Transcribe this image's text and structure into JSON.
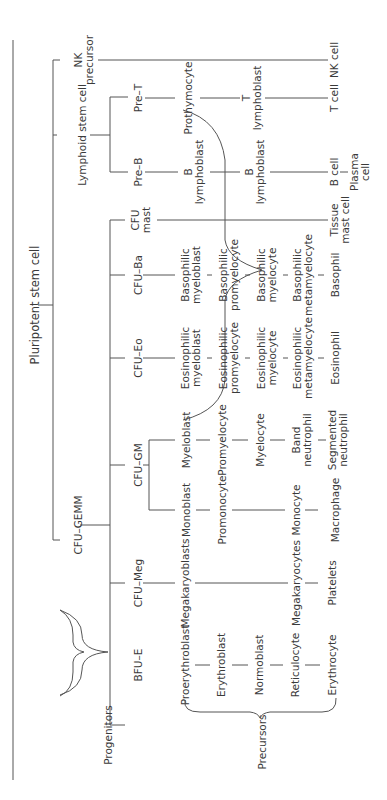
{
  "diagram": {
    "root": "Pluripotent stem cell",
    "group_labels": {
      "progenitors": "Progenitors",
      "precursors": "Precursors"
    },
    "level1": {
      "nk_precursor": "NK\nprecursor",
      "lymphoid_stem_cell": "Lymphoid stem cell",
      "cfu_gemm": "CFU–GEMM"
    },
    "lymphoid": {
      "pre_t": "Pre–T",
      "prothymocyte": "Prothymocyte",
      "t_lymphoblast": "T\nlymphoblast",
      "t_cell": "T cell",
      "pre_b": "Pre–B",
      "b_lymphoblast_1": "B\nlymphoblast",
      "b_lymphoblast_2": "B\nlymphoblast",
      "b_cell": "B cell",
      "plasma_cell": "Plasma\ncell",
      "nk_cell": "NK cell"
    },
    "mast": {
      "progenitor": "CFU\nmast",
      "mature": "Tissue\nmast cell"
    },
    "basophil": {
      "progenitor": "CFU–Ba",
      "stages": [
        "Basophilic\nmyeloblast",
        "Basophilic\npromyelocyte",
        "Basophilic\nmyelocyte",
        "Basophilic\nmetamyelocyte",
        "Basophil"
      ]
    },
    "eosinophil": {
      "progenitor": "CFU–Eo",
      "stages": [
        "Eosinophilic\nmyeloblast",
        "Eosinophilic\npromyelocyte",
        "Eosinophilic\nmyelocyte",
        "Eosinophilic\nmetamyelocyte",
        "Eosinophil"
      ]
    },
    "granulocyte_monocyte": {
      "progenitor": "CFU–GM",
      "neutrophil_stages": [
        "Myeloblast",
        "Promyelocyte",
        "Myelocyte",
        "Band\nneutrophil",
        "Segmented\nneutrophil"
      ],
      "monocyte_stages": [
        "Monoblast",
        "Promonocyte",
        "Monocyte",
        "Macrophage"
      ]
    },
    "megakaryocyte": {
      "progenitor": "CFU–Meg",
      "stages": [
        "Megakaryoblasts",
        "Megakaryocytes",
        "Platelets"
      ]
    },
    "erythroid": {
      "progenitor": "BFU–E",
      "stages": [
        "Proerythroblast",
        "Erythroblast",
        "Normoblast",
        "Reticulocyte",
        "Erythrocyte"
      ]
    },
    "line_color": "#555555",
    "text_color": "#3a3a3a"
  }
}
